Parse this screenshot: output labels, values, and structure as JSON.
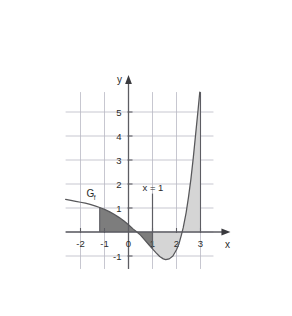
{
  "chart_data": {
    "type": "line",
    "title": "",
    "xlabel": "x",
    "ylabel": "y",
    "xlim": [
      -2.62,
      3.54
    ],
    "ylim": [
      -1.54,
      5.83
    ],
    "grid": true,
    "grid_spacing": 1,
    "legend": "none",
    "x_ticks": [
      -2,
      -1,
      0,
      1,
      2,
      3
    ],
    "x_tick_labels": [
      "-2",
      "-1",
      "0",
      "1",
      "2",
      "3"
    ],
    "y_ticks": [
      1,
      2,
      3,
      4,
      5
    ],
    "y_tick_labels": [
      "1",
      "2",
      "3",
      "4",
      "5"
    ],
    "series": [
      {
        "name": "Gf",
        "label": "G",
        "label_subscript": "f",
        "points": [
          [
            -2.62,
            1.36
          ],
          [
            -2.4,
            1.32
          ],
          [
            -2.2,
            1.28
          ],
          [
            -2.0,
            1.24
          ],
          [
            -1.8,
            1.2
          ],
          [
            -1.6,
            1.15
          ],
          [
            -1.4,
            1.09
          ],
          [
            -1.2,
            1.02
          ],
          [
            -1.0,
            0.94
          ],
          [
            -0.8,
            0.85
          ],
          [
            -0.6,
            0.74
          ],
          [
            -0.4,
            0.61
          ],
          [
            -0.2,
            0.47
          ],
          [
            0.0,
            0.3
          ],
          [
            0.2,
            0.12
          ],
          [
            0.35,
            0.0
          ],
          [
            0.5,
            -0.13
          ],
          [
            0.7,
            -0.36
          ],
          [
            0.85,
            -0.53
          ],
          [
            1.0,
            -0.7
          ],
          [
            1.15,
            -0.87
          ],
          [
            1.3,
            -1.02
          ],
          [
            1.45,
            -1.12
          ],
          [
            1.55,
            -1.15
          ],
          [
            1.7,
            -1.12
          ],
          [
            1.85,
            -1.0
          ],
          [
            2.0,
            -0.74
          ],
          [
            2.1,
            -0.5
          ],
          [
            2.2,
            -0.14
          ],
          [
            2.28,
            0.18
          ],
          [
            2.4,
            0.8
          ],
          [
            2.5,
            1.45
          ],
          [
            2.6,
            2.2
          ],
          [
            2.7,
            3.1
          ],
          [
            2.8,
            4.1
          ],
          [
            2.9,
            5.1
          ],
          [
            2.97,
            5.83
          ]
        ]
      }
    ],
    "shaded_regions": [
      {
        "name": "dark-region",
        "color": "#7d7d7d",
        "x_start": -1.2,
        "x_end": 1.0,
        "description": "area between curve and x-axis from x=-1.2 to x=1"
      },
      {
        "name": "light-region",
        "color": "#d5d5d5",
        "x_start": 1.0,
        "x_end": 3.0,
        "description": "area between curve and x-axis from x=1 to x=3"
      }
    ],
    "annotations": [
      {
        "name": "vertical-line-x-1",
        "text": "x = 1",
        "x": 1,
        "y_top": 1.6,
        "y_bottom": -0.7,
        "label_x": 1.02,
        "label_y": 1.72
      },
      {
        "name": "curve-label",
        "text": "Gf",
        "x": -1.75,
        "y": 1.44
      }
    ],
    "colors": {
      "grid": "#b9b9c4",
      "axis": "#6b6b72",
      "curve": "#555558",
      "dark_fill": "#7d7d7d",
      "light_fill": "#d5d5d5",
      "text": "#2b2b2b",
      "background": "#ffffff"
    }
  },
  "axes": {
    "x_axis_label": "x",
    "y_axis_label": "y"
  }
}
